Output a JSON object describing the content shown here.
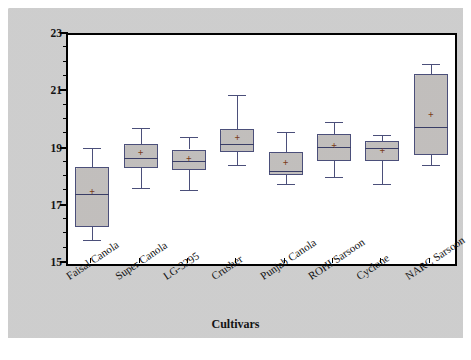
{
  "chart_data": {
    "type": "box",
    "title": "",
    "xlabel": "Cultivars",
    "ylabel": "Harvest Index",
    "ylim": [
      15,
      23
    ],
    "ytick_major": [
      15,
      17,
      19,
      21,
      23
    ],
    "ytick_minor": [
      15.5,
      16,
      16.5,
      17.5,
      18,
      18.5,
      19.5,
      20,
      20.5,
      21.5,
      22,
      22.5
    ],
    "grid": false,
    "legend": "none",
    "categories": [
      "Faisal Canola",
      "Super Canola",
      "LG-3295",
      "Crusher",
      "Punjab Canola",
      "ROHI Sarsoon",
      "Cyclone",
      "NARC Sarsoon"
    ],
    "boxes": [
      {
        "name": "Faisal Canola",
        "whisker_low": 15.85,
        "q1": 16.3,
        "median": 17.45,
        "q3": 18.4,
        "whisker_high": 19.05,
        "mean": 17.55
      },
      {
        "name": "Super Canola",
        "whisker_low": 17.65,
        "q1": 18.35,
        "median": 18.7,
        "q3": 19.2,
        "whisker_high": 19.75,
        "mean": 18.9
      },
      {
        "name": "LG-3295",
        "whisker_low": 17.6,
        "q1": 18.3,
        "median": 18.6,
        "q3": 19.0,
        "whisker_high": 19.45,
        "mean": 18.7
      },
      {
        "name": "Crusher",
        "whisker_low": 18.45,
        "q1": 18.9,
        "median": 19.2,
        "q3": 19.7,
        "whisker_high": 20.9,
        "mean": 19.45
      },
      {
        "name": "Punjab Canola",
        "whisker_low": 17.8,
        "q1": 18.1,
        "median": 18.25,
        "q3": 18.9,
        "whisker_high": 19.6,
        "mean": 18.55
      },
      {
        "name": "ROHI Sarsoon",
        "whisker_low": 18.05,
        "q1": 18.6,
        "median": 19.1,
        "q3": 19.55,
        "whisker_high": 19.95,
        "mean": 19.15
      },
      {
        "name": "Cyclone",
        "whisker_low": 17.8,
        "q1": 18.6,
        "median": 19.05,
        "q3": 19.3,
        "whisker_high": 19.5,
        "mean": 19.0
      },
      {
        "name": "NARC Sarsoon",
        "whisker_low": 18.45,
        "q1": 18.8,
        "median": 19.8,
        "q3": 21.65,
        "whisker_high": 22.0,
        "mean": 20.25
      }
    ],
    "colors": {
      "box_fill": "#c9c6c4",
      "box_edge": "#4b4f7a",
      "median": "#393d66",
      "mean_marker": "#7a3b18",
      "plot_bg": "#ffffff",
      "panel_bg": "#d4d4d4",
      "axis": "#000000",
      "text": "#141414"
    },
    "mean_marker_glyph": "plus-marker"
  }
}
